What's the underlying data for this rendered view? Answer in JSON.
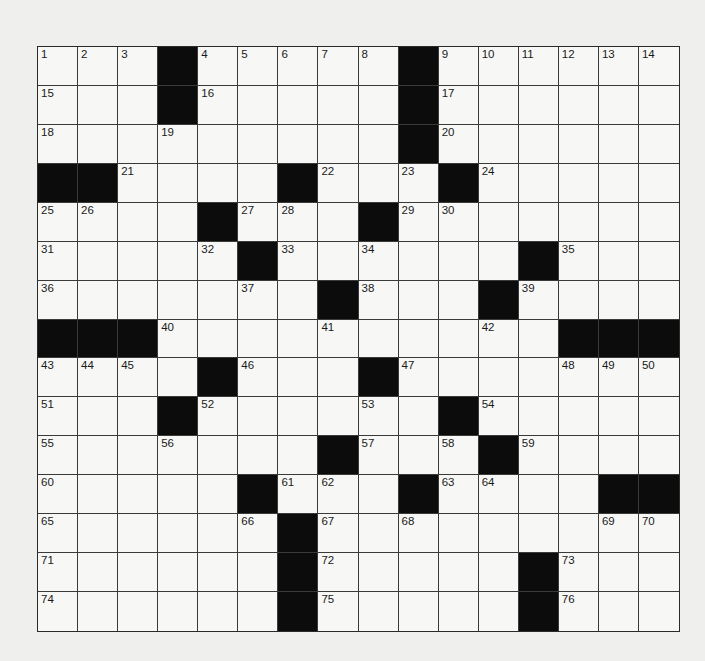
{
  "puzzle": {
    "rows": 15,
    "cols": 16,
    "legend": {
      "black": "#",
      "white": "."
    },
    "layout": [
      "...#.....#......",
      "...#.....#......",
      ".........#......",
      "##....#...#.....",
      "....#...#.......",
      ".....#......#...",
      ".......#...#....",
      "###..........###",
      "....#...#.......",
      "...#......#.....",
      ".......#...#....",
      ".....#....#....##",
      "......#.........",
      "......#.....#...",
      "......#.....#..."
    ],
    "numbers": [
      [
        1,
        2,
        3,
        null,
        4,
        5,
        6,
        7,
        8,
        null,
        9,
        10,
        11,
        12,
        13,
        14
      ],
      [
        15,
        null,
        null,
        null,
        16,
        null,
        null,
        null,
        null,
        null,
        17,
        null,
        null,
        null,
        null,
        null
      ],
      [
        18,
        null,
        null,
        19,
        null,
        null,
        null,
        null,
        null,
        null,
        20,
        null,
        null,
        null,
        null,
        null
      ],
      [
        null,
        null,
        21,
        null,
        null,
        null,
        null,
        22,
        null,
        23,
        null,
        24,
        null,
        null,
        null,
        null
      ],
      [
        25,
        26,
        null,
        null,
        null,
        27,
        28,
        null,
        null,
        29,
        30,
        null,
        null,
        null,
        null,
        null
      ],
      [
        31,
        null,
        null,
        null,
        32,
        null,
        33,
        null,
        34,
        null,
        null,
        null,
        null,
        35,
        null,
        null
      ],
      [
        36,
        null,
        null,
        null,
        null,
        37,
        null,
        null,
        38,
        null,
        null,
        null,
        39,
        null,
        null,
        null
      ],
      [
        null,
        null,
        null,
        40,
        null,
        null,
        null,
        41,
        null,
        null,
        null,
        42,
        null,
        null,
        null,
        null
      ],
      [
        43,
        44,
        45,
        null,
        null,
        46,
        null,
        null,
        null,
        47,
        null,
        null,
        null,
        48,
        49,
        50
      ],
      [
        51,
        null,
        null,
        null,
        52,
        null,
        null,
        null,
        53,
        null,
        null,
        54,
        null,
        null,
        null,
        null
      ],
      [
        55,
        null,
        null,
        56,
        null,
        null,
        null,
        null,
        57,
        null,
        58,
        null,
        59,
        null,
        null,
        null
      ],
      [
        60,
        null,
        null,
        null,
        null,
        null,
        61,
        62,
        null,
        null,
        63,
        64,
        null,
        null,
        null,
        null
      ],
      [
        65,
        null,
        null,
        null,
        null,
        66,
        null,
        67,
        null,
        68,
        null,
        null,
        null,
        null,
        69,
        70
      ],
      [
        71,
        null,
        null,
        null,
        null,
        null,
        null,
        72,
        null,
        null,
        null,
        null,
        null,
        73,
        null,
        null
      ],
      [
        74,
        null,
        null,
        null,
        null,
        null,
        null,
        75,
        null,
        null,
        null,
        null,
        null,
        76,
        null,
        null
      ]
    ],
    "blacks": [
      [
        0,
        3
      ],
      [
        0,
        9
      ],
      [
        1,
        3
      ],
      [
        1,
        9
      ],
      [
        2,
        9
      ],
      [
        3,
        0
      ],
      [
        3,
        1
      ],
      [
        3,
        6
      ],
      [
        3,
        10
      ],
      [
        4,
        4
      ],
      [
        4,
        8
      ],
      [
        5,
        5
      ],
      [
        5,
        12
      ],
      [
        6,
        7
      ],
      [
        6,
        11
      ],
      [
        7,
        0
      ],
      [
        7,
        1
      ],
      [
        7,
        2
      ],
      [
        7,
        13
      ],
      [
        7,
        14
      ],
      [
        7,
        15
      ],
      [
        8,
        4
      ],
      [
        8,
        8
      ],
      [
        9,
        3
      ],
      [
        9,
        10
      ],
      [
        10,
        7
      ],
      [
        10,
        11
      ],
      [
        11,
        5
      ],
      [
        11,
        9
      ],
      [
        11,
        14
      ],
      [
        11,
        15
      ],
      [
        12,
        6
      ],
      [
        13,
        6
      ],
      [
        13,
        12
      ],
      [
        14,
        6
      ],
      [
        14,
        12
      ]
    ],
    "entries": {}
  },
  "colors": {
    "page_bg": "#efefed",
    "cell_white": "#f7f7f5",
    "cell_black": "#0c0c0c",
    "grid_line": "#3a3a3a"
  }
}
